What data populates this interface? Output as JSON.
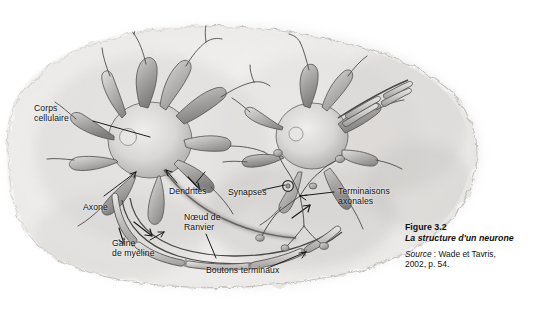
{
  "figure": {
    "background_color": "#ffffff",
    "illustration": {
      "name": "neuron-structure-illustration",
      "medium": "pencil-and-wash drawing on torn-edge paper",
      "subject": "two interconnected neurons showing cell bodies, dendrites, axons, myelin sheath and terminal buttons",
      "palette": {
        "paper": "#f4f3f1",
        "paper_shadow": "#cfcdc9",
        "ink": "#4a4a4a",
        "ink_dark": "#222222",
        "wash_light": "#d6d4d2",
        "wash_mid": "#a9a7a6",
        "wash_dark": "#7b7977"
      }
    },
    "labels": [
      {
        "id": "corps-cellulaire",
        "text": "Corps\ncellulaire",
        "x": 34,
        "y": 103
      },
      {
        "id": "axone",
        "text": "Axone",
        "x": 83,
        "y": 203
      },
      {
        "id": "dendrites",
        "text": "Dendrites",
        "x": 169,
        "y": 187
      },
      {
        "id": "noeud-de-ranvier",
        "text": "Nœud de\nRanvier",
        "x": 184,
        "y": 212
      },
      {
        "id": "gaine-de-myeline",
        "text": "Gaine\nde myéline",
        "x": 112,
        "y": 238
      },
      {
        "id": "boutons-terminaux",
        "text": "Boutons terminaux",
        "x": 206,
        "y": 266
      },
      {
        "id": "synapses",
        "text": "Synapses",
        "x": 228,
        "y": 188
      },
      {
        "id": "terminaisons-axonales",
        "text": "Terminaisons\naxonales",
        "x": 338,
        "y": 186
      }
    ],
    "caption": {
      "number": "Figure 3.2",
      "title": "La structure d'un neurone",
      "source_word": "Source",
      "source_separator": " : ",
      "source_text": "Wade et Tavris,",
      "source_text_line2": "2002, p. 54."
    }
  }
}
